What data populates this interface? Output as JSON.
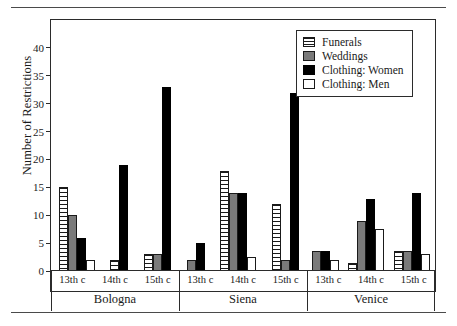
{
  "chart_data": {
    "type": "bar",
    "title": "",
    "xlabel": "",
    "ylabel": "Number of Restrictions",
    "ylim": [
      0,
      45
    ],
    "ytick_labels": [
      "0",
      "5",
      "10",
      "15",
      "20",
      "25",
      "30",
      "35",
      "40"
    ],
    "ytick_values": [
      0,
      5,
      10,
      15,
      20,
      25,
      30,
      35,
      40
    ],
    "grid": false,
    "legend_position": "top-right",
    "group_labels": [
      "Bologna",
      "Siena",
      "Venice"
    ],
    "categories": [
      "Bologna 13th c",
      "Bologna 14th c",
      "Bologna 15th c",
      "Siena 13th c",
      "Siena 14th c",
      "Siena 15th c",
      "Venice 13th c",
      "Venice 14th c",
      "Venice 15th c"
    ],
    "century_labels": [
      "13th c",
      "14th c",
      "15th c"
    ],
    "series": [
      {
        "name": "Funerals",
        "color": "#ffffff",
        "pattern": "horizontal-stripes",
        "values": [
          15,
          2,
          3,
          0,
          18,
          12,
          0,
          1.5,
          3.5
        ]
      },
      {
        "name": "Weddings",
        "color": "#7a7a7a",
        "pattern": "solid-gray",
        "values": [
          10,
          0,
          3,
          2,
          14,
          2,
          3.5,
          9,
          3.5
        ]
      },
      {
        "name": "Clothing: Women",
        "color": "#000000",
        "pattern": "solid-black",
        "values": [
          6,
          19,
          33,
          5,
          14,
          32,
          3.5,
          13,
          14
        ]
      },
      {
        "name": "Clothing: Men",
        "color": "#ffffff",
        "pattern": "solid-white",
        "values": [
          2,
          0,
          0,
          0,
          2.5,
          0,
          2,
          7.5,
          3
        ]
      }
    ]
  },
  "legend": {
    "items": [
      {
        "label": "Funerals"
      },
      {
        "label": "Weddings"
      },
      {
        "label": "Clothing: Women"
      },
      {
        "label": "Clothing: Men"
      }
    ]
  }
}
